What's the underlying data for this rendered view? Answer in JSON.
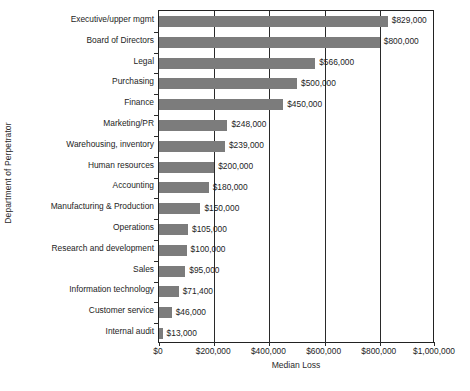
{
  "chart_data": {
    "type": "bar",
    "orientation": "horizontal",
    "title": "",
    "xlabel": "Median Loss",
    "ylabel": "Department of Perpetrator",
    "xlim": [
      0,
      1000000
    ],
    "grid": true,
    "legend": null,
    "xticks": [
      0,
      200000,
      400000,
      600000,
      800000,
      1000000
    ],
    "xtick_labels": [
      "$0",
      "$200,000",
      "$400,000",
      "$600,000",
      "$800,000",
      "$1,000,000"
    ],
    "categories": [
      "Executive/upper mgmt",
      "Board of Directors",
      "Legal",
      "Purchasing",
      "Finance",
      "Marketing/PR",
      "Warehousing, inventory",
      "Human resources",
      "Accounting",
      "Manufacturing & Production",
      "Operations",
      "Research and development",
      "Sales",
      "Information technology",
      "Customer service",
      "Internal audit"
    ],
    "values": [
      829000,
      800000,
      566000,
      500000,
      450000,
      248000,
      239000,
      200000,
      180000,
      150000,
      105000,
      100000,
      95000,
      71400,
      46000,
      13000
    ],
    "value_labels": [
      "$829,000",
      "$800,000",
      "$566,000",
      "$500,000",
      "$450,000",
      "$248,000",
      "$239,000",
      "$200,000",
      "$180,000",
      "$150,000",
      "$105,000",
      "$100,000",
      "$95,000",
      "$71,400",
      "$46,000",
      "$13,000"
    ],
    "bar_color": "#7c7c7c",
    "axis_color": "#2a2a2a",
    "background": "#ffffff"
  }
}
